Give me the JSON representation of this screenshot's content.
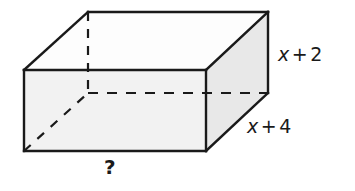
{
  "figure": {
    "name": "rectangular-prism",
    "style": {
      "stroke_color": "#1a1a1a",
      "stroke_width": 2.2,
      "dash_color": "#1a1a1a",
      "face_top_fill": "#fdfdfd",
      "face_front_fill": "#f2f2f2",
      "face_right_fill": "#e8e8e8",
      "background": "#ffffff"
    },
    "vertices": {
      "front_top_left": [
        24,
        70
      ],
      "front_top_right": [
        206,
        70
      ],
      "front_bottom_left": [
        24,
        151
      ],
      "front_bottom_right": [
        206,
        151
      ],
      "back_top_left": [
        88,
        12
      ],
      "back_top_right": [
        268,
        12
      ],
      "back_bottom_left": [
        88,
        93
      ],
      "back_bottom_right": [
        268,
        93
      ]
    },
    "hidden_edges": [
      "back_top_left-to-back_bottom_left",
      "back_bottom_left-to-back_bottom_right",
      "front_bottom_left-to-back_bottom_left"
    ]
  },
  "labels": {
    "height": {
      "name": "height-label",
      "variable": "x",
      "operator": "+",
      "constant": "2",
      "full_text": "x + 2"
    },
    "depth": {
      "name": "depth-label",
      "variable": "x",
      "operator": "+",
      "constant": "4",
      "full_text": "x + 4"
    },
    "width": {
      "name": "width-label",
      "full_text": "?"
    }
  }
}
